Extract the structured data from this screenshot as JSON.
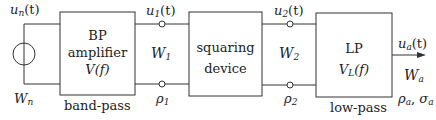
{
  "source": {
    "signal": "u",
    "signal_sub": "n",
    "signal_arg": "(t)",
    "bandwidth": "W",
    "bandwidth_sub": "n"
  },
  "blocks": [
    {
      "id": "bp",
      "lines": [
        "BP",
        "amplifier",
        "V(f)"
      ],
      "caption": "band-pass"
    },
    {
      "id": "squaring",
      "lines": [
        "squaring",
        "device"
      ],
      "caption": ""
    },
    {
      "id": "lp",
      "lines": [
        "LP",
        "V_L(f)"
      ],
      "line2_main": "V",
      "line2_sub": "L",
      "line2_arg": "(f)",
      "caption": "low-pass"
    }
  ],
  "nodes": [
    {
      "signal": "u",
      "signal_sub": "1",
      "signal_arg": "(t)",
      "bandwidth": "W",
      "bandwidth_sub": "1",
      "snr": "ρ",
      "snr_sub": "1"
    },
    {
      "signal": "u",
      "signal_sub": "2",
      "signal_arg": "(t)",
      "bandwidth": "W",
      "bandwidth_sub": "2",
      "snr": "ρ",
      "snr_sub": "2"
    }
  ],
  "output": {
    "signal": "u",
    "signal_sub": "a",
    "signal_arg": "(t)",
    "bandwidth": "W",
    "bandwidth_sub": "a",
    "snr": "ρ",
    "snr_sub": "a",
    "sep": ", ",
    "sigma": "σ",
    "sigma_sub": "a"
  },
  "colors": {
    "line": "#333333",
    "text": "#222222",
    "background": "#ffffff"
  }
}
